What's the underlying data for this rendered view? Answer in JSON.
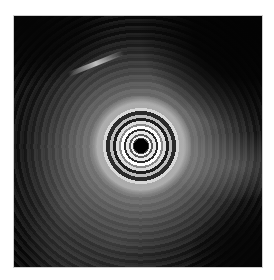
{
  "image": {
    "description": "Radial endoscopic ultrasound image with concentric transducer rings at center surrounded by hyperechoic tissue",
    "background_color": "#050505",
    "frame_border_color": "#cfcfcf",
    "page_background": "#ffffff"
  }
}
